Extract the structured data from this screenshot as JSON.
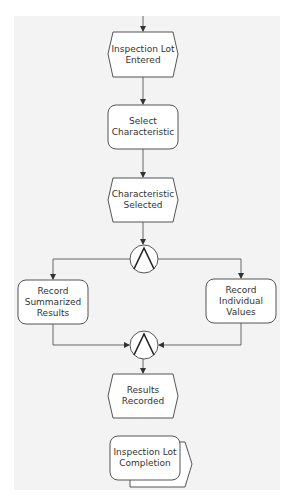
{
  "diagram": {
    "type": "EPC process flow",
    "colors": {
      "background": "#ffffff",
      "panel": "#f3f3f3",
      "stroke": "#555555",
      "node_fill": "#ffffff",
      "text": "#333333"
    },
    "nodes": [
      {
        "id": "event-1",
        "shape": "hexagon",
        "kind": "event",
        "line1": "Inspection Lot",
        "line2": "Entered"
      },
      {
        "id": "func-1",
        "shape": "rounded-rect",
        "kind": "function",
        "line1": "Select",
        "line2": "Characteristic"
      },
      {
        "id": "event-2",
        "shape": "hexagon",
        "kind": "event",
        "line1": "Characteristic",
        "line2": "Selected"
      },
      {
        "id": "and-split",
        "shape": "circle",
        "kind": "AND connector",
        "symbol": "∧"
      },
      {
        "id": "func-2",
        "shape": "rounded-rect",
        "kind": "function",
        "line1": "Record",
        "line2": "Summarized",
        "line3": "Results"
      },
      {
        "id": "func-3",
        "shape": "rounded-rect",
        "kind": "function",
        "line1": "Record",
        "line2": "Individual",
        "line3": "Values"
      },
      {
        "id": "and-join",
        "shape": "circle",
        "kind": "AND connector",
        "symbol": "∧"
      },
      {
        "id": "event-3",
        "shape": "hexagon",
        "kind": "event",
        "line1": "Results",
        "line2": "Recorded"
      },
      {
        "id": "interface-1",
        "shape": "process-interface",
        "kind": "process path",
        "line1": "Inspection Lot",
        "line2": "Completion"
      }
    ],
    "edges": [
      [
        "start",
        "event-1"
      ],
      [
        "event-1",
        "func-1"
      ],
      [
        "func-1",
        "event-2"
      ],
      [
        "event-2",
        "and-split"
      ],
      [
        "and-split",
        "func-2"
      ],
      [
        "and-split",
        "func-3"
      ],
      [
        "func-2",
        "and-join"
      ],
      [
        "func-3",
        "and-join"
      ],
      [
        "and-join",
        "event-3"
      ]
    ]
  }
}
